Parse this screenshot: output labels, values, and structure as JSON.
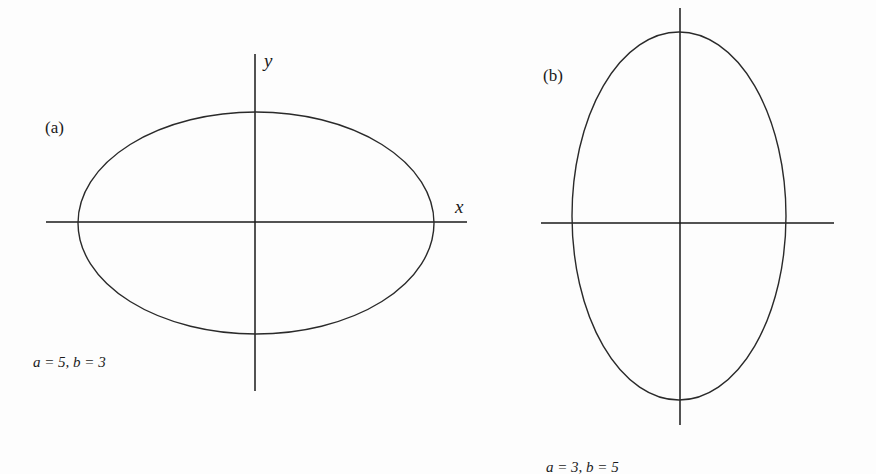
{
  "figure": {
    "panels": [
      {
        "id": "a",
        "label": "(a)",
        "params_text": "a = 5, b = 3",
        "a": 5,
        "b": 3,
        "x_axis_label": "x",
        "y_axis_label": "y",
        "orientation": "horizontal major axis"
      },
      {
        "id": "b",
        "label": "(b)",
        "params_text": "a = 3, b = 5",
        "a": 3,
        "b": 5,
        "orientation": "vertical major axis"
      }
    ],
    "colors": {
      "stroke": "#1a1a1a",
      "background": "#fdfdfd"
    }
  }
}
